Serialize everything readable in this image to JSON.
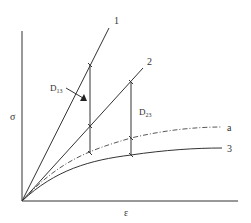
{
  "diagram": {
    "axes": {
      "y_label": "σ",
      "x_label": "ε",
      "origin": [
        22,
        201
      ],
      "y_top": 31,
      "x_right": 238
    },
    "curves": [
      {
        "id": "1",
        "label": "1",
        "style": "solid",
        "type": "line",
        "from": [
          22,
          201
        ],
        "to": [
          109,
          28
        ]
      },
      {
        "id": "2",
        "label": "2",
        "style": "solid",
        "type": "line",
        "from": [
          22,
          201
        ],
        "to": [
          143,
          68
        ]
      },
      {
        "id": "a",
        "label": "a",
        "style": "dash-dot",
        "type": "curve",
        "end": [
          222,
          127
        ]
      },
      {
        "id": "3",
        "label": "3",
        "style": "solid",
        "type": "curve",
        "end": [
          222,
          148
        ]
      }
    ],
    "measures": [
      {
        "label": "D",
        "subscript": "13",
        "x": 90,
        "y_top": 65,
        "y_bottom": 153,
        "ticks": [
          65,
          126,
          153
        ]
      },
      {
        "label": "D",
        "subscript": "23",
        "x": 131,
        "y_top": 82,
        "y_bottom": 155,
        "ticks": [
          82,
          138,
          155
        ]
      }
    ],
    "colors": {
      "line": "#333333",
      "background": "#ffffff"
    }
  }
}
